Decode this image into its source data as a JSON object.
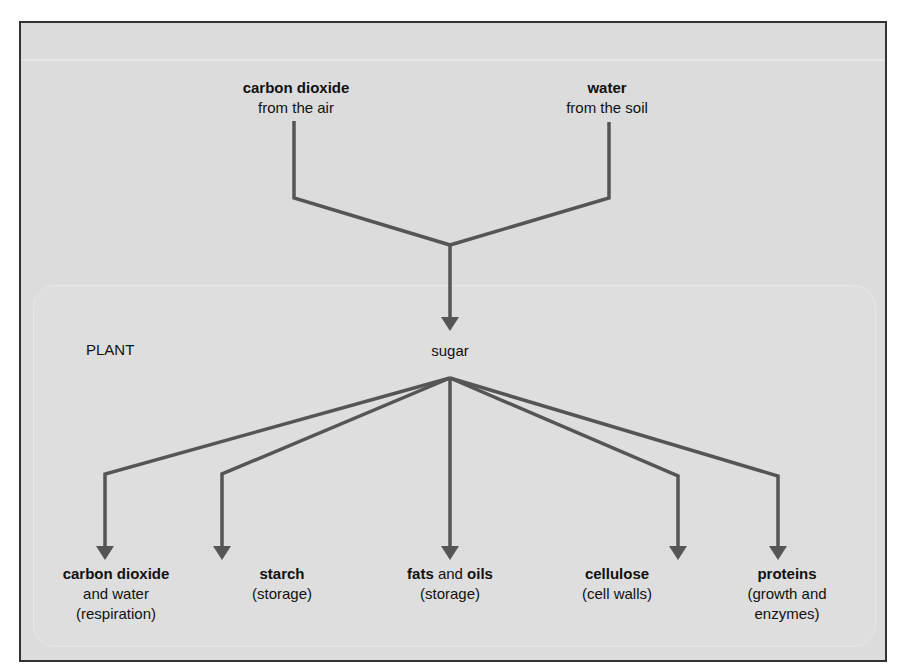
{
  "diagram": {
    "inputs": [
      {
        "bold": "carbon dioxide",
        "sub": "from the air"
      },
      {
        "bold": "water",
        "sub": "from the soil"
      }
    ],
    "plant_label": "PLANT",
    "center": "sugar",
    "outputs": [
      {
        "bold": "carbon dioxide",
        "rest": "",
        "line2": "and water",
        "line3": "(respiration)"
      },
      {
        "bold": "starch",
        "rest": "",
        "line2": "(storage)",
        "line3": ""
      },
      {
        "bold": "fats",
        "mid": "and",
        "bold2": "oils",
        "line2": "(storage)",
        "line3": ""
      },
      {
        "bold": "cellulose",
        "rest": "",
        "line2": "(cell walls)",
        "line3": ""
      },
      {
        "bold": "proteins",
        "rest": "",
        "line2": "(growth and",
        "line3": "enzymes)"
      }
    ],
    "colors": {
      "line": "#555555",
      "background": "#dcdcdc",
      "border": "#333333"
    }
  }
}
